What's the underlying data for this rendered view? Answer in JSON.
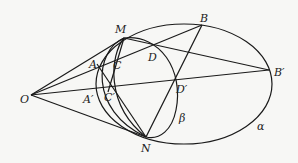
{
  "diagram": {
    "labels": {
      "O": "O",
      "M": "M",
      "N": "N",
      "A": "A",
      "C": "C",
      "A_prime": "A′",
      "C_prime": "C′",
      "B": "B",
      "B_prime": "B′",
      "D": "D",
      "D_prime": "D′",
      "alpha": "α",
      "beta": "β"
    },
    "colors": {
      "stroke": "#1a1a1a",
      "background": "#f7f7f5"
    }
  }
}
